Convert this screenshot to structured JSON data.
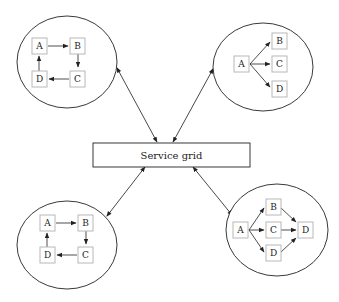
{
  "diagram": {
    "center": {
      "label": "Service grid"
    },
    "clusters": [
      {
        "id": "top-left",
        "pattern": "cycle",
        "nodes": [
          "A",
          "B",
          "C",
          "D"
        ],
        "edges": [
          [
            "A",
            "B"
          ],
          [
            "B",
            "C"
          ],
          [
            "C",
            "D"
          ],
          [
            "D",
            "A"
          ]
        ]
      },
      {
        "id": "top-right",
        "pattern": "fan-out",
        "nodes": [
          "A",
          "B",
          "C",
          "D"
        ],
        "edges": [
          [
            "A",
            "B"
          ],
          [
            "A",
            "C"
          ],
          [
            "A",
            "D"
          ]
        ]
      },
      {
        "id": "bottom-left",
        "pattern": "cycle",
        "nodes": [
          "A",
          "B",
          "C",
          "D"
        ],
        "edges": [
          [
            "A",
            "B"
          ],
          [
            "B",
            "C"
          ],
          [
            "C",
            "D"
          ],
          [
            "D",
            "A"
          ]
        ]
      },
      {
        "id": "bottom-right",
        "pattern": "fan-out-fan-in",
        "nodes": [
          "A",
          "B",
          "C",
          "D",
          "D"
        ],
        "edges": [
          [
            "A",
            "B"
          ],
          [
            "A",
            "C"
          ],
          [
            "A",
            "D"
          ],
          [
            "B",
            "D"
          ],
          [
            "C",
            "D"
          ],
          [
            "D",
            "D"
          ]
        ]
      }
    ],
    "links": [
      {
        "from": "top-left",
        "to": "Service grid",
        "bidirectional": true
      },
      {
        "from": "top-right",
        "to": "Service grid",
        "bidirectional": true
      },
      {
        "from": "bottom-left",
        "to": "Service grid",
        "bidirectional": true
      },
      {
        "from": "bottom-right",
        "to": "Service grid",
        "bidirectional": true
      }
    ],
    "labels": {
      "tl": {
        "a": "A",
        "b": "B",
        "c": "C",
        "d": "D"
      },
      "tr": {
        "a": "A",
        "b": "B",
        "c": "C",
        "d": "D"
      },
      "bl": {
        "a": "A",
        "b": "B",
        "c": "C",
        "d": "D"
      },
      "br": {
        "a": "A",
        "b": "B",
        "c": "C",
        "d1": "D",
        "d2": "D"
      }
    }
  }
}
